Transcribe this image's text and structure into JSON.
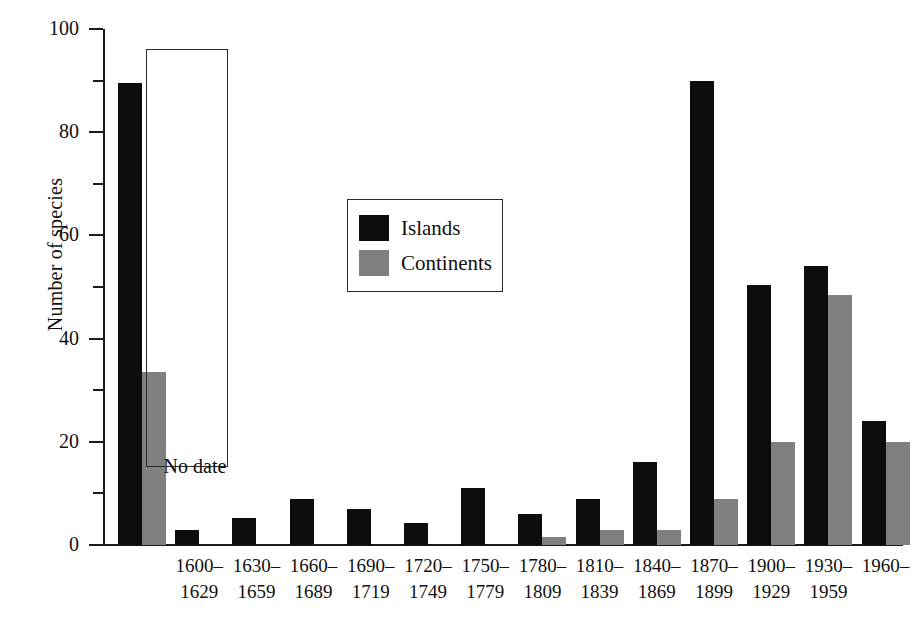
{
  "chart_data": {
    "type": "bar",
    "title": "",
    "xlabel": "",
    "ylabel": "Number of species",
    "ylim": [
      0,
      100
    ],
    "y_ticks_major": [
      0,
      20,
      40,
      60,
      80,
      100
    ],
    "y_ticks_minor": [
      10,
      30,
      50,
      70,
      90
    ],
    "grid": false,
    "legend_position": "upper-center",
    "categories": [
      "No date",
      "1600–\n1629",
      "1630–\n1659",
      "1660–\n1689",
      "1690–\n1719",
      "1720–\n1749",
      "1750–\n1779",
      "1780–\n1809",
      "1810–\n1839",
      "1840–\n1869",
      "1870–\n1899",
      "1900–\n1929",
      "1930–\n1959",
      "1960–"
    ],
    "series": [
      {
        "name": "Islands",
        "color": "#0d0d0d",
        "values": [
          89.5,
          3,
          5.3,
          9,
          7,
          4.2,
          11,
          6,
          9,
          16,
          90,
          50.3,
          54,
          24
        ]
      },
      {
        "name": "Continents",
        "color": "#808080",
        "values": [
          33.5,
          0,
          0,
          0,
          0,
          0,
          0,
          1.5,
          3,
          3,
          9,
          20,
          48.5,
          20
        ]
      }
    ],
    "annotations": [
      {
        "text": "No date",
        "note": "boxed first group set apart from the time series"
      }
    ]
  },
  "axis": {
    "y_title": "Number of species",
    "y_tick_labels": [
      "0",
      "20",
      "40",
      "60",
      "80",
      "100"
    ]
  },
  "legend": {
    "entries": [
      {
        "label": "Islands",
        "color": "#0d0d0d"
      },
      {
        "label": "Continents",
        "color": "#808080"
      }
    ]
  },
  "x_axis": {
    "labels": [
      {
        "line1": "No date",
        "line2": ""
      },
      {
        "line1": "1600–",
        "line2": "1629"
      },
      {
        "line1": "1630–",
        "line2": "1659"
      },
      {
        "line1": "1660–",
        "line2": "1689"
      },
      {
        "line1": "1690–",
        "line2": "1719"
      },
      {
        "line1": "1720–",
        "line2": "1749"
      },
      {
        "line1": "1750–",
        "line2": "1779"
      },
      {
        "line1": "1780–",
        "line2": "1809"
      },
      {
        "line1": "1810–",
        "line2": "1839"
      },
      {
        "line1": "1840–",
        "line2": "1869"
      },
      {
        "line1": "1870–",
        "line2": "1899"
      },
      {
        "line1": "1900–",
        "line2": "1929"
      },
      {
        "line1": "1930–",
        "line2": "1959"
      },
      {
        "line1": "1960–",
        "line2": ""
      }
    ]
  },
  "nodate": {
    "label": "No date"
  }
}
